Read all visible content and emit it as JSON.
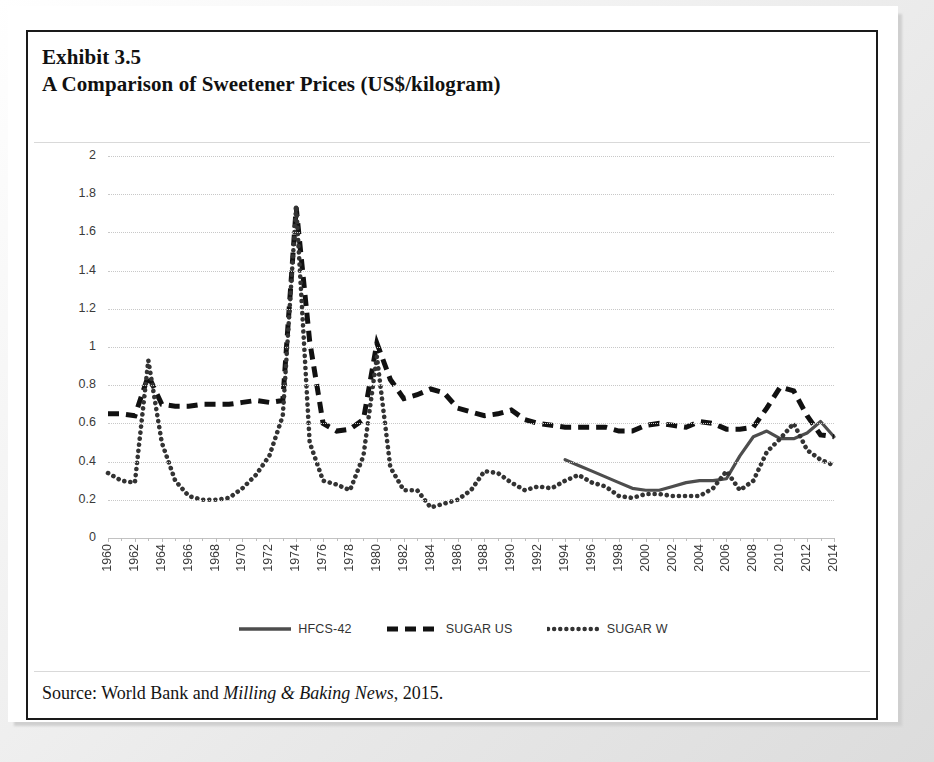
{
  "exhibit": {
    "number_label": "Exhibit 3.5",
    "title": "A Comparison of Sweetener Prices (US$/kilogram)",
    "source_prefix": "Source: World Bank and ",
    "source_italic": "Milling & Baking News",
    "source_suffix": ", 2015."
  },
  "chart_data": {
    "type": "line",
    "title": "A Comparison of Sweetener Prices (US$/kilogram)",
    "xlabel": "",
    "ylabel": "",
    "ylim": [
      0,
      2
    ],
    "ytick_step": 0.2,
    "grid": true,
    "legend_position": "bottom",
    "ytick_labels": [
      "2",
      "1.8",
      "1.6",
      "1.4",
      "1.2",
      "1",
      "0.8",
      "0.6",
      "0.4",
      "0.2",
      "0"
    ],
    "yticks": [
      2,
      1.8,
      1.6,
      1.4,
      1.2,
      1,
      0.8,
      0.6,
      0.4,
      0.2,
      0
    ],
    "xtick_labels": [
      "1960",
      "1962",
      "1964",
      "1966",
      "1968",
      "1970",
      "1972",
      "1974",
      "1976",
      "1978",
      "1980",
      "1982",
      "1984",
      "1986",
      "1988",
      "1990",
      "1992",
      "1994",
      "1996",
      "1998",
      "2000",
      "2002",
      "2004",
      "2006",
      "2008",
      "2010",
      "2012",
      "2014"
    ],
    "x": [
      1960,
      1961,
      1962,
      1963,
      1964,
      1965,
      1966,
      1967,
      1968,
      1969,
      1970,
      1971,
      1972,
      1973,
      1974,
      1975,
      1976,
      1977,
      1978,
      1979,
      1980,
      1981,
      1982,
      1983,
      1984,
      1985,
      1986,
      1987,
      1988,
      1989,
      1990,
      1991,
      1992,
      1993,
      1994,
      1995,
      1996,
      1997,
      1998,
      1999,
      2000,
      2001,
      2002,
      2003,
      2004,
      2005,
      2006,
      2007,
      2008,
      2009,
      2010,
      2011,
      2012,
      2013,
      2014
    ],
    "series": [
      {
        "name": "HFCS-42",
        "style": "solid",
        "color": "#4d4d4d",
        "x": [
          1994,
          1995,
          1996,
          1997,
          1998,
          1999,
          2000,
          2001,
          2002,
          2003,
          2004,
          2005,
          2006,
          2007,
          2008,
          2009,
          2010,
          2011,
          2012,
          2013,
          2014
        ],
        "values": [
          0.41,
          0.38,
          0.35,
          0.32,
          0.29,
          0.26,
          0.25,
          0.25,
          0.27,
          0.29,
          0.3,
          0.3,
          0.31,
          0.43,
          0.53,
          0.56,
          0.52,
          0.52,
          0.55,
          0.61,
          0.53
        ]
      },
      {
        "name": "SUGAR US",
        "style": "dashed",
        "color": "#111111",
        "x": [
          1960,
          1961,
          1962,
          1963,
          1964,
          1965,
          1966,
          1967,
          1968,
          1969,
          1970,
          1971,
          1972,
          1973,
          1974,
          1975,
          1976,
          1977,
          1978,
          1979,
          1980,
          1981,
          1982,
          1983,
          1984,
          1985,
          1986,
          1987,
          1988,
          1989,
          1990,
          1991,
          1992,
          1993,
          1994,
          1995,
          1996,
          1997,
          1998,
          1999,
          2000,
          2001,
          2002,
          2003,
          2004,
          2005,
          2006,
          2007,
          2008,
          2009,
          2010,
          2011,
          2012,
          2013,
          2014
        ],
        "values": [
          0.65,
          0.65,
          0.64,
          0.85,
          0.7,
          0.69,
          0.69,
          0.7,
          0.7,
          0.7,
          0.71,
          0.72,
          0.71,
          0.72,
          1.73,
          1.03,
          0.6,
          0.56,
          0.57,
          0.62,
          1.02,
          0.83,
          0.73,
          0.75,
          0.78,
          0.76,
          0.68,
          0.66,
          0.64,
          0.65,
          0.67,
          0.62,
          0.6,
          0.59,
          0.58,
          0.58,
          0.58,
          0.58,
          0.56,
          0.56,
          0.59,
          0.6,
          0.59,
          0.58,
          0.61,
          0.6,
          0.57,
          0.57,
          0.58,
          0.68,
          0.79,
          0.77,
          0.64,
          0.54,
          0.53
        ]
      },
      {
        "name": "SUGAR W",
        "style": "dotted",
        "color": "#333333",
        "x": [
          1960,
          1961,
          1962,
          1963,
          1964,
          1965,
          1966,
          1967,
          1968,
          1969,
          1970,
          1971,
          1972,
          1973,
          1974,
          1975,
          1976,
          1977,
          1978,
          1979,
          1980,
          1981,
          1982,
          1983,
          1984,
          1985,
          1986,
          1987,
          1988,
          1989,
          1990,
          1991,
          1992,
          1993,
          1994,
          1995,
          1996,
          1997,
          1998,
          1999,
          2000,
          2001,
          2002,
          2003,
          2004,
          2005,
          2006,
          2007,
          2008,
          2009,
          2010,
          2011,
          2012,
          2013,
          2014
        ],
        "values": [
          0.34,
          0.3,
          0.29,
          0.93,
          0.5,
          0.3,
          0.22,
          0.2,
          0.2,
          0.21,
          0.26,
          0.33,
          0.43,
          0.64,
          1.74,
          0.5,
          0.3,
          0.28,
          0.25,
          0.43,
          0.95,
          0.37,
          0.25,
          0.25,
          0.16,
          0.18,
          0.2,
          0.25,
          0.35,
          0.34,
          0.29,
          0.25,
          0.27,
          0.26,
          0.3,
          0.33,
          0.29,
          0.27,
          0.22,
          0.21,
          0.23,
          0.23,
          0.22,
          0.22,
          0.22,
          0.26,
          0.35,
          0.25,
          0.3,
          0.45,
          0.52,
          0.6,
          0.46,
          0.41,
          0.38
        ]
      }
    ]
  },
  "legend": [
    {
      "label": "HFCS-42",
      "style": "solid",
      "swatch": "legend-swatch-solid"
    },
    {
      "label": "SUGAR US",
      "style": "dashed",
      "swatch": "legend-swatch-dashed"
    },
    {
      "label": "SUGAR W",
      "style": "dotted",
      "swatch": "legend-swatch-dotted"
    }
  ],
  "colors": {
    "hfcs": "#4d4d4d",
    "sugar_us": "#111111",
    "sugar_w": "#333333",
    "grid": "#c8c8c8",
    "frame": "#1a1a1a",
    "text": "#111111"
  }
}
